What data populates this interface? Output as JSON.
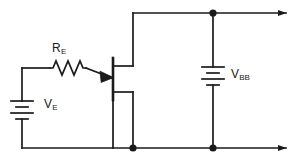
{
  "figure": {
    "kind": "schematic-diagram",
    "width": 296,
    "height": 164,
    "background_color": "#ffffff",
    "wire_color": "#1a1a1a",
    "label_color": "#1a1a1a"
  },
  "labels": {
    "resistor_emitter": {
      "symbol": "R",
      "subscript": "E"
    },
    "source_emitter": {
      "symbol": "V",
      "subscript": "E"
    },
    "source_base_bias": {
      "symbol": "V",
      "subscript": "BB"
    }
  },
  "components": {
    "resistor": {
      "name": "R_E",
      "type": "resistor",
      "orientation": "horizontal",
      "zigzag_peaks": 3
    },
    "battery_left": {
      "name": "V_E",
      "type": "battery",
      "orientation": "vertical",
      "plates": 4
    },
    "battery_right": {
      "name": "V_BB",
      "type": "battery",
      "orientation": "vertical",
      "plates": 4
    },
    "transistor": {
      "name": "Q1",
      "type": "bjt-pnp",
      "arrow_on": "emitter",
      "arrow_direction": "into-base"
    }
  },
  "nodes": {
    "junction_top_right": {
      "label": "top rail node"
    },
    "junction_bottom_collector": {
      "label": "collector return node"
    },
    "junction_bottom_right": {
      "label": "bottom rail node"
    }
  },
  "terminals": {
    "output_top": {
      "label": "top output arrow",
      "direction": "right"
    },
    "output_bottom": {
      "label": "bottom output arrow",
      "direction": "right"
    }
  }
}
